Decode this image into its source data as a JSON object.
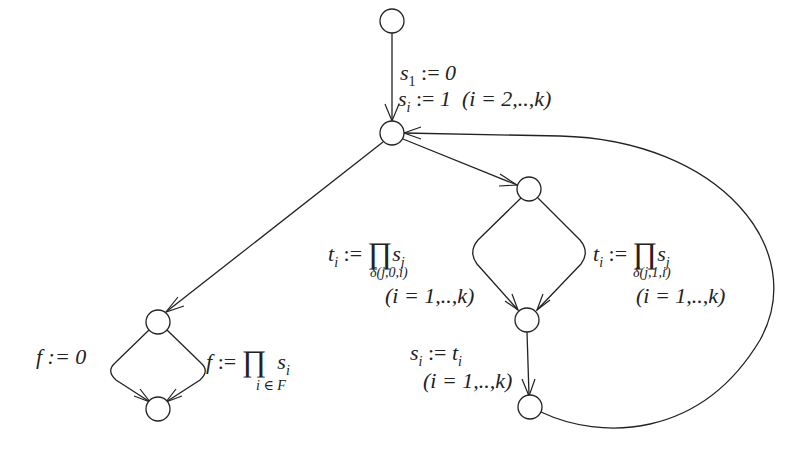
{
  "diagram": {
    "nodes": [
      {
        "id": "n0",
        "x": 392,
        "y": 21
      },
      {
        "id": "n1",
        "x": 392,
        "y": 133
      },
      {
        "id": "n2",
        "x": 529,
        "y": 189
      },
      {
        "id": "n3",
        "x": 158,
        "y": 322
      },
      {
        "id": "n4",
        "x": 158,
        "y": 409
      },
      {
        "id": "n5",
        "x": 527,
        "y": 320
      },
      {
        "id": "n6",
        "x": 530,
        "y": 407
      }
    ],
    "labels": {
      "init": {
        "line1_var": "s",
        "line1_sub": "1",
        "line1_op": ":=",
        "line1_val": "0",
        "line2_var": "s",
        "line2_sub": "i",
        "line2_op": ":=",
        "line2_val": "1",
        "line2_range": "(i = 2,..,k)"
      },
      "left_branch": {
        "var": "t",
        "sub": "i",
        "op": ":=",
        "prod": "∏",
        "term": "s",
        "term_sub": "j",
        "under": "δ(j,0,i)",
        "range": "(i = 1,..,k)"
      },
      "right_branch": {
        "var": "t",
        "sub": "i",
        "op": ":=",
        "prod": "∏",
        "term": "s",
        "term_sub": "j",
        "under": "δ(j,1,i)",
        "range": "(i = 1,..,k)"
      },
      "assign": {
        "var": "s",
        "sub": "i",
        "op": ":=",
        "val": "t",
        "val_sub": "i",
        "range": "(i = 1,..,k)"
      },
      "f_zero": {
        "text": "f := 0"
      },
      "f_prod": {
        "var": "f",
        "op": ":=",
        "prod": "∏",
        "term": "s",
        "term_sub": "i",
        "under": "i ∈ F"
      }
    }
  }
}
